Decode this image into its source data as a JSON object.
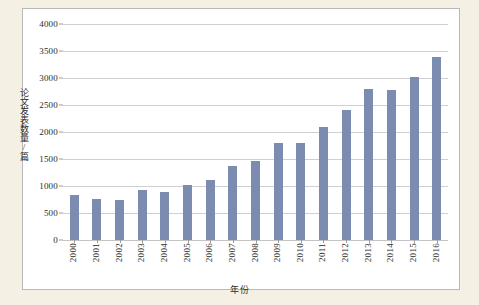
{
  "chart_data": {
    "type": "bar",
    "title": "",
    "xlabel": "年份",
    "ylabel": "论文发表数量/篇",
    "categories": [
      "2000",
      "2001",
      "2002",
      "2003",
      "2004",
      "2005",
      "2006",
      "2007",
      "2008",
      "2009",
      "2010",
      "2011",
      "2012",
      "2013",
      "2014",
      "2015",
      "2016"
    ],
    "values": [
      830,
      760,
      740,
      920,
      890,
      1010,
      1120,
      1370,
      1470,
      1800,
      1800,
      2100,
      2400,
      2800,
      2780,
      3020,
      3390
    ],
    "ylim": [
      0,
      4000
    ],
    "yticks": [
      0,
      500,
      1000,
      1500,
      2000,
      2500,
      3000,
      3500,
      4000
    ],
    "ytick_labels": [
      "0",
      "500",
      "1000",
      "1500",
      "2000",
      "2500",
      "3000",
      "3500",
      "4000"
    ],
    "grid": true,
    "legend": "none",
    "bar_color": "#7c8cb0",
    "gridline_color": "#d0d0d0",
    "axis_text_color": "#2b2b2b",
    "page_background": "#f4f1e4",
    "plot_background": "#ffffff",
    "frame_border_color": "#b9b9b9"
  }
}
